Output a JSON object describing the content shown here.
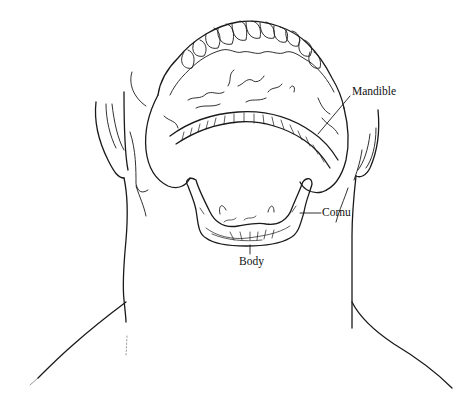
{
  "figure": {
    "line_color": "#1a1a1a",
    "background": "#ffffff",
    "labels": {
      "mandible": "Mandible",
      "cornu": "Cornu",
      "body": "Body"
    }
  }
}
